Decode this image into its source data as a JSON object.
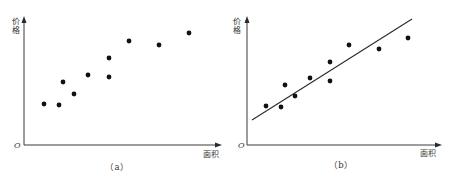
{
  "chart_data": [
    {
      "type": "scatter",
      "panel_label": "（a）",
      "title": "",
      "xlabel": "面积",
      "ylabel": "价格",
      "origin_label": "O",
      "grid": false,
      "legend": null,
      "axes_px": {
        "origin": [
          24,
          145
        ],
        "x_end": 222,
        "y_end": 17
      },
      "points_px": [
        [
          44,
          104
        ],
        [
          59,
          105
        ],
        [
          63,
          82
        ],
        [
          74,
          94
        ],
        [
          88,
          75
        ],
        [
          109,
          77
        ],
        [
          109,
          58
        ],
        [
          129,
          41
        ],
        [
          159,
          45
        ],
        [
          189,
          33
        ]
      ],
      "x": [
        20,
        35,
        39,
        50,
        64,
        85,
        85,
        105,
        135,
        165
      ],
      "y": [
        41,
        40,
        63,
        51,
        70,
        68,
        87,
        104,
        100,
        112
      ],
      "note": "Values are relative units (no tick labels on axes); x = px from origin, y = px above x-axis."
    },
    {
      "type": "scatter",
      "panel_label": "（b）",
      "title": "",
      "xlabel": "面积",
      "ylabel": "价格",
      "origin_label": "O",
      "grid": false,
      "legend": null,
      "axes_px": {
        "origin": [
          247,
          145
        ],
        "x_end": 442,
        "y_end": 17
      },
      "points_px": [
        [
          266,
          106
        ],
        [
          281,
          107
        ],
        [
          285,
          85
        ],
        [
          295,
          96
        ],
        [
          310,
          78
        ],
        [
          330,
          81
        ],
        [
          330,
          62
        ],
        [
          349,
          45
        ],
        [
          379,
          49
        ],
        [
          408,
          38
        ]
      ],
      "x": [
        19,
        34,
        38,
        48,
        63,
        83,
        83,
        102,
        132,
        161
      ],
      "y": [
        39,
        38,
        60,
        49,
        67,
        64,
        83,
        100,
        96,
        107
      ],
      "fit_line_px": [
        [
          252,
          120
        ],
        [
          412,
          19
        ]
      ],
      "fit_line": {
        "x": [
          5,
          165
        ],
        "y": [
          25,
          126
        ]
      },
      "note": "Same data as (a) with a fitted regression line; values are relative units."
    }
  ],
  "panels": [
    {
      "id": "a",
      "caption": "（a）",
      "ylabel_top": "价",
      "ylabel_bottom": "格",
      "xlabel": "面积",
      "origin": "O"
    },
    {
      "id": "b",
      "caption": "（b）",
      "ylabel_top": "价",
      "ylabel_bottom": "格",
      "xlabel": "面积",
      "origin": "O"
    }
  ]
}
